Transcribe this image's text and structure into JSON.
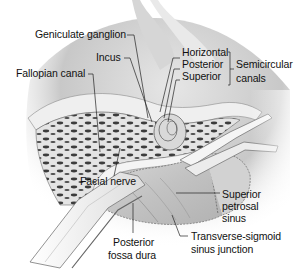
{
  "figure": {
    "type": "anatomical illustration",
    "palette": {
      "background": "#ffffff",
      "ink": "#111111",
      "bone_light": "#e8e8e8",
      "bone_trabecular_dark": "#3a3a3a",
      "dura": "#cfcfcf",
      "shadow": "#9a9a9a",
      "retractor": "#f2f2f2"
    }
  },
  "labels": {
    "geniculate_ganglion": "Geniculate ganglion",
    "incus": "Incus",
    "fallopian_canal": "Fallopian canal",
    "horizontal": "Horizontal",
    "posterior": "Posterior",
    "superior": "Superior",
    "semicircular_canals_line1": "Semicircular",
    "semicircular_canals_line2": "canals",
    "facial_nerve": "Facial nerve",
    "superior_petrosal_sinus_line1": "Superior",
    "superior_petrosal_sinus_line2": "petrosal",
    "superior_petrosal_sinus_line3": "sinus",
    "transverse_sigmoid_line1": "Transverse-sigmoid",
    "transverse_sigmoid_line2": "sinus junction",
    "posterior_fossa_dura_line1": "Posterior",
    "posterior_fossa_dura_line2": "fossa dura"
  }
}
